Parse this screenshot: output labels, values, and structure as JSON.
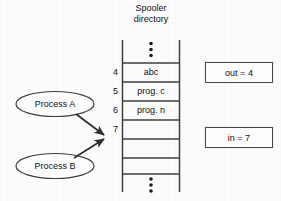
{
  "diagram": {
    "title_line1": "Spooler",
    "title_line2": "directory",
    "table": {
      "ellipsis_top": "vertical-ellipsis",
      "ellipsis_bottom": "vertical-ellipsis",
      "rows": [
        {
          "index": "4",
          "value": "abc"
        },
        {
          "index": "5",
          "value": "prog. c"
        },
        {
          "index": "6",
          "value": "prog. n"
        },
        {
          "index": "7",
          "value": ""
        },
        {
          "index": "",
          "value": ""
        }
      ]
    },
    "variables": [
      {
        "label": "out = 4"
      },
      {
        "label": "in = 7"
      }
    ],
    "processes": [
      {
        "label": "Process A"
      },
      {
        "label": "Process B"
      }
    ],
    "arrows": [
      {
        "from": "Process A",
        "to": "slot 7"
      },
      {
        "from": "Process B",
        "to": "slot 7"
      }
    ],
    "colors": {
      "stroke": "#3f3f3f",
      "background": "#fcfcfc",
      "text": "#111111"
    }
  }
}
